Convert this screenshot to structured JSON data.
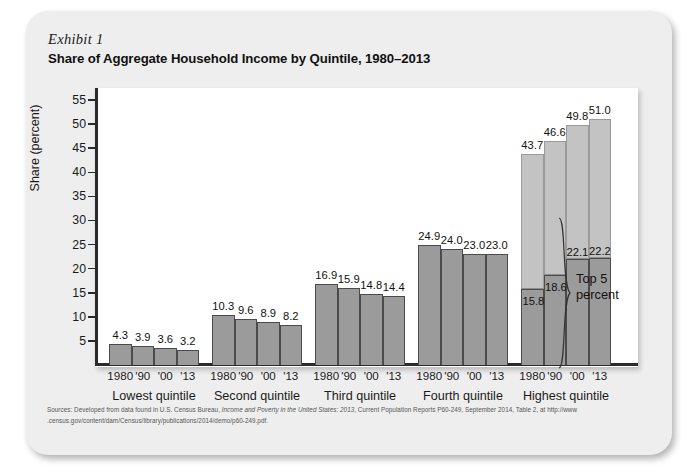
{
  "card": {
    "exhibit_label": "Exhibit 1",
    "title": "Share of Aggregate Household Income by Quintile, 1980–2013"
  },
  "annotation": {
    "top5_line1": "Top 5",
    "top5_line2": "percent"
  },
  "source": {
    "prefix": "Sources: Developed from data found in U.S. Census Bureau, ",
    "italic": "Income and Poverty in the United States: 2013",
    "suffix": ", Current Population Reports P60-249, September 2014, Table 2, at http://www",
    "line2": ".census.gov/content/dam/Census/library/publications/2014/demo/p60-249.pdf."
  },
  "chart_data": {
    "type": "bar",
    "title": "Share of Aggregate Household Income by Quintile, 1980–2013",
    "subtitle": "Exhibit 1",
    "xlabel": "",
    "ylabel": "Share (percent)",
    "ylim": [
      0,
      57.5
    ],
    "yticks": [
      5,
      10,
      15,
      20,
      25,
      30,
      35,
      40,
      45,
      50,
      55
    ],
    "ytick_labels": [
      "5",
      "10",
      "15",
      "20",
      "25",
      "30",
      "35",
      "40",
      "45",
      "50",
      "55"
    ],
    "grid": false,
    "legend": false,
    "year_labels": [
      "1980",
      "'90",
      "'00",
      "'13"
    ],
    "groups": [
      {
        "label": "Lowest quintile",
        "values": [
          4.3,
          3.9,
          3.6,
          3.2
        ]
      },
      {
        "label": "Second quintile",
        "values": [
          10.3,
          9.6,
          8.9,
          8.2
        ]
      },
      {
        "label": "Third quintile",
        "values": [
          16.9,
          15.9,
          14.8,
          14.4
        ]
      },
      {
        "label": "Fourth quintile",
        "values": [
          24.9,
          24.0,
          23.0,
          23.0
        ]
      },
      {
        "label": "Highest quintile",
        "values": [
          43.7,
          46.6,
          49.8,
          51.0
        ],
        "segment_label": "Top 5 percent",
        "segment_values": [
          15.8,
          18.6,
          22.1,
          22.2
        ]
      }
    ],
    "value_labels": {
      "lowest": [
        "4.3",
        "3.9",
        "3.6",
        "3.2"
      ],
      "second": [
        "10.3",
        "9.6",
        "8.9",
        "8.2"
      ],
      "third": [
        "16.9",
        "15.9",
        "14.8",
        "14.4"
      ],
      "fourth": [
        "24.9",
        "24.0",
        "23.0",
        "23.0"
      ],
      "highest": [
        "43.7",
        "46.6",
        "49.8",
        "51.0"
      ],
      "top5": [
        "15.8",
        "18.6",
        "22.1",
        "22.2"
      ]
    },
    "colors": {
      "bar": "#9b9b9b",
      "bar_top_segment": "#c3c3c3",
      "bar_border": "#4b4b4b",
      "axis": "#2b2b2b",
      "panel_background": "#ffffff",
      "card_background": "#eeeeee"
    }
  }
}
